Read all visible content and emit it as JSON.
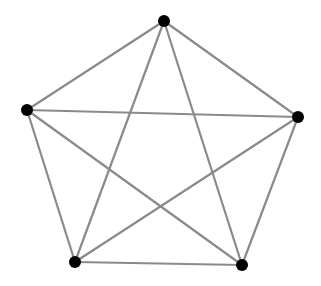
{
  "diagram": {
    "type": "graph",
    "name": "complete-graph-K5",
    "background": "#ffffff",
    "edge_color": "#8a8a8a",
    "node_color": "#000000",
    "node_radius": 6,
    "nodes": [
      {
        "id": "n1",
        "label": "",
        "x": 164,
        "y": 21
      },
      {
        "id": "n2",
        "label": "",
        "x": 27,
        "y": 110
      },
      {
        "id": "n3",
        "label": "",
        "x": 298,
        "y": 117
      },
      {
        "id": "n4",
        "label": "",
        "x": 75,
        "y": 262
      },
      {
        "id": "n5",
        "label": "",
        "x": 242,
        "y": 265
      }
    ],
    "edges": [
      [
        "n1",
        "n2"
      ],
      [
        "n1",
        "n3"
      ],
      [
        "n1",
        "n4"
      ],
      [
        "n1",
        "n5"
      ],
      [
        "n2",
        "n3"
      ],
      [
        "n2",
        "n4"
      ],
      [
        "n2",
        "n5"
      ],
      [
        "n3",
        "n4"
      ],
      [
        "n3",
        "n5"
      ],
      [
        "n4",
        "n5"
      ]
    ]
  }
}
